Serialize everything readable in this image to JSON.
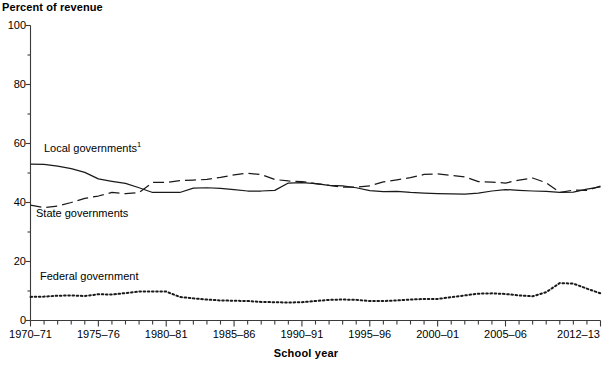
{
  "chart_data": {
    "type": "line",
    "title": "",
    "ylabel": "Percent of revenue",
    "xlabel": "School year",
    "ylim": [
      0,
      100
    ],
    "yticks": [
      0,
      20,
      40,
      60,
      80,
      100
    ],
    "ytick_labels": [
      "0",
      "20",
      "40",
      "60",
      "80",
      "100"
    ],
    "minor_ytick_step": 10,
    "grid": false,
    "legend_position": "inline-annotations",
    "x": [
      "1970-71",
      "1971-72",
      "1972-73",
      "1973-74",
      "1974-75",
      "1975-76",
      "1976-77",
      "1977-78",
      "1978-79",
      "1979-80",
      "1980-81",
      "1981-82",
      "1982-83",
      "1983-84",
      "1984-85",
      "1985-86",
      "1986-87",
      "1987-88",
      "1988-89",
      "1989-90",
      "1990-91",
      "1991-92",
      "1992-93",
      "1993-94",
      "1994-95",
      "1995-96",
      "1996-97",
      "1997-98",
      "1998-99",
      "1999-2000",
      "2000-01",
      "2001-02",
      "2002-03",
      "2003-04",
      "2004-05",
      "2005-06",
      "2006-07",
      "2007-08",
      "2008-09",
      "2009-10",
      "2010-11",
      "2011-12",
      "2012-13"
    ],
    "xtick_labels": [
      "1970-71",
      "1975-76",
      "1980-81",
      "1985-86",
      "1990-91",
      "1995-96",
      "2000-01",
      "2005-06",
      "2012-13"
    ],
    "xtick_label_indices": [
      0,
      5,
      10,
      15,
      20,
      25,
      30,
      35,
      42
    ],
    "series": [
      {
        "name": "Local governments",
        "label": "Local governments",
        "label_superscript": "1",
        "style": "solid",
        "color": "#1a1a1a",
        "values": [
          53.0,
          52.9,
          52.3,
          51.5,
          50.2,
          48.0,
          47.2,
          46.5,
          45.0,
          43.4,
          43.4,
          43.4,
          44.9,
          45.0,
          44.8,
          44.4,
          43.9,
          43.9,
          44.1,
          46.6,
          46.7,
          46.4,
          45.8,
          45.6,
          45.0,
          44.0,
          43.7,
          43.8,
          43.4,
          43.2,
          43.0,
          42.9,
          42.8,
          43.2,
          43.9,
          44.4,
          44.1,
          43.9,
          43.8,
          43.4,
          43.5,
          44.5,
          45.3
        ]
      },
      {
        "name": "State governments",
        "label": "State governments",
        "style": "dashed",
        "color": "#1a1a1a",
        "values": [
          39.1,
          38.3,
          38.8,
          40.0,
          41.4,
          42.2,
          43.4,
          43.0,
          43.4,
          46.8,
          46.8,
          47.4,
          47.6,
          47.8,
          48.5,
          49.4,
          49.9,
          49.5,
          47.8,
          47.3,
          47.1,
          46.4,
          45.8,
          45.2,
          45.2,
          45.6,
          47.0,
          47.7,
          48.4,
          49.5,
          49.7,
          49.2,
          48.7,
          47.1,
          46.9,
          46.6,
          47.6,
          48.3,
          46.7,
          43.4,
          44.2,
          44.1,
          45.6
        ]
      },
      {
        "name": "Federal government",
        "label": "Federal government",
        "style": "dotted",
        "color": "#1a1a1a",
        "values": [
          8.0,
          8.1,
          8.4,
          8.5,
          8.3,
          8.9,
          8.8,
          9.3,
          9.8,
          9.8,
          9.8,
          8.0,
          7.5,
          7.1,
          6.8,
          6.7,
          6.6,
          6.3,
          6.2,
          6.1,
          6.2,
          6.6,
          7.0,
          7.1,
          7.0,
          6.6,
          6.6,
          6.8,
          7.1,
          7.3,
          7.3,
          7.9,
          8.5,
          9.1,
          9.2,
          9.0,
          8.5,
          8.2,
          9.6,
          12.7,
          12.5,
          10.8,
          9.2
        ]
      }
    ]
  }
}
